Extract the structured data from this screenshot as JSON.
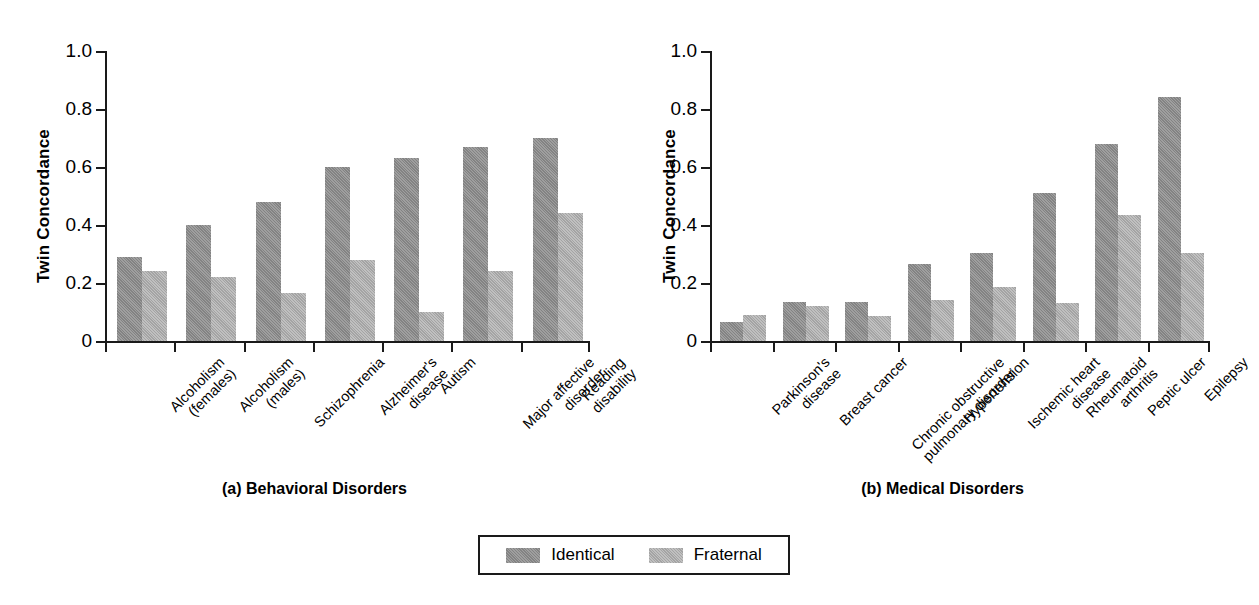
{
  "chart_data": [
    {
      "type": "bar",
      "panel_id": "a",
      "title": "(a) Behavioral Disorders",
      "xlabel": "",
      "ylabel": "Twin Concordance",
      "ylim": [
        0,
        1.0
      ],
      "yticks": [
        0,
        0.2,
        0.4,
        0.6,
        0.8,
        1.0
      ],
      "ytick_labels": [
        "0",
        "0.2",
        "0.4",
        "0.6",
        "0.8",
        "1.0"
      ],
      "grid": false,
      "legend_position": "bottom-center-shared",
      "categories": [
        "Alcoholism\n(females)",
        "Alcoholism\n(males)",
        "Schizophrenia",
        "Alzheimer's\ndisease",
        "Autism",
        "Major affective\ndisorder",
        "Reading\ndisability"
      ],
      "series": [
        {
          "name": "Identical",
          "color": "#8d8d8d",
          "values": [
            0.29,
            0.4,
            0.48,
            0.6,
            0.63,
            0.67,
            0.7
          ]
        },
        {
          "name": "Fraternal",
          "color": "#aeaeae",
          "values": [
            0.24,
            0.22,
            0.165,
            0.28,
            0.1,
            0.24,
            0.44
          ]
        }
      ]
    },
    {
      "type": "bar",
      "panel_id": "b",
      "title": "(b) Medical Disorders",
      "xlabel": "",
      "ylabel": "Twin Concordance",
      "ylim": [
        0,
        1.0
      ],
      "yticks": [
        0,
        0.2,
        0.4,
        0.6,
        0.8,
        1.0
      ],
      "ytick_labels": [
        "0",
        "0.2",
        "0.4",
        "0.6",
        "0.8",
        "1.0"
      ],
      "grid": false,
      "legend_position": "bottom-center-shared",
      "categories": [
        "Parkinson's\ndisease",
        "Breast cancer",
        "Chronic obstructive\npulmonary disorder",
        "Hypertension",
        "Ischemic heart\ndisease",
        "Rheumatoid\narthritis",
        "Peptic ulcer",
        "Epilepsy"
      ],
      "series": [
        {
          "name": "Identical",
          "color": "#8d8d8d",
          "values": [
            0.065,
            0.135,
            0.135,
            0.265,
            0.305,
            0.51,
            0.68,
            0.84
          ]
        },
        {
          "name": "Fraternal",
          "color": "#aeaeae",
          "values": [
            0.09,
            0.12,
            0.085,
            0.14,
            0.185,
            0.13,
            0.435,
            0.305
          ]
        }
      ]
    }
  ],
  "legend": {
    "items": [
      {
        "label": "Identical",
        "color": "#8d8d8d"
      },
      {
        "label": "Fraternal",
        "color": "#aeaeae"
      }
    ]
  }
}
